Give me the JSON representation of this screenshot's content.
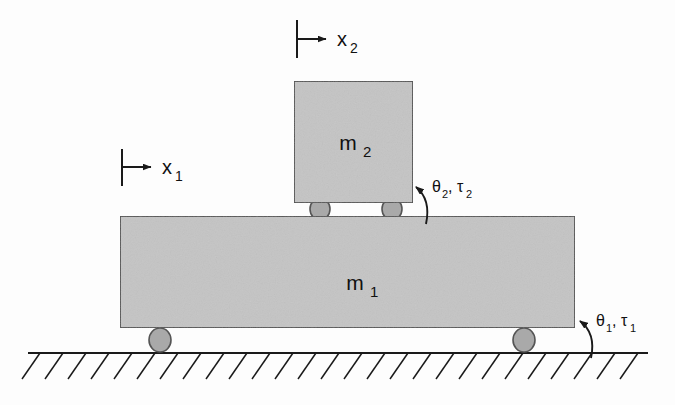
{
  "figure": {
    "background_color": "#fdfdfd",
    "line_color": "#1a1a1a",
    "block_fill": "#c4c4c4",
    "block_stroke": "#4a4a4a",
    "wheel_fill": "#a9a9a9",
    "wheel_stroke": "#555555",
    "ground_color": "#1a1a1a"
  },
  "masses": [
    {
      "id": "m1",
      "label": "m",
      "subscript": "1",
      "x": 120,
      "y": 216,
      "width": 455,
      "height": 112,
      "label_x": 355,
      "label_y": 290
    },
    {
      "id": "m2",
      "label": "m",
      "subscript": "2",
      "x": 294,
      "y": 81,
      "width": 119,
      "height": 122,
      "label_x": 350,
      "label_y": 150
    }
  ],
  "wheels": [
    {
      "id": "m2-wheel-left",
      "cx": 320,
      "cy": 209,
      "rx": 10,
      "ry": 11
    },
    {
      "id": "m2-wheel-right",
      "cx": 392,
      "cy": 209,
      "rx": 10,
      "ry": 11
    },
    {
      "id": "m1-wheel-left",
      "cx": 160,
      "cy": 340,
      "rx": 11,
      "ry": 12
    },
    {
      "id": "m1-wheel-right",
      "cx": 524,
      "cy": 340,
      "rx": 11,
      "ry": 12
    }
  ],
  "coordinate_arrows": [
    {
      "id": "x2",
      "label": "x",
      "subscript": "2",
      "tick_x": 297,
      "tick_y1": 20,
      "tick_y2": 58,
      "arrow_y": 39,
      "arrow_x2": 326,
      "label_x": 334,
      "label_y": 46
    },
    {
      "id": "x1",
      "label": "x",
      "subscript": "1",
      "tick_x": 122,
      "tick_y1": 149,
      "tick_y2": 186,
      "arrow_y": 167,
      "arrow_x2": 151,
      "label_x": 159,
      "label_y": 174
    }
  ],
  "torque_labels": [
    {
      "id": "theta2-tau2",
      "text": "θ₂, τ₂",
      "theta": "θ",
      "theta_sub": "2",
      "tau": "τ",
      "tau_sub": "2",
      "label_x": 437,
      "label_y": 195,
      "arc_start_x": 425,
      "arc_start_y": 224,
      "arc_end_x": 414,
      "arc_end_y": 186
    },
    {
      "id": "theta1-tau1",
      "text": "θ₁, τ₁",
      "theta": "θ",
      "theta_sub": "1",
      "tau": "τ",
      "tau_sub": "1",
      "label_x": 601,
      "label_y": 329,
      "arc_start_x": 590,
      "arc_start_y": 358,
      "arc_end_x": 578,
      "arc_end_y": 320
    }
  ],
  "ground": {
    "line_x1": 28,
    "line_x2": 648,
    "line_y": 353,
    "hatch_count": 27,
    "hatch_spacing": 23,
    "hatch_dx": -18,
    "hatch_dy": 26
  }
}
